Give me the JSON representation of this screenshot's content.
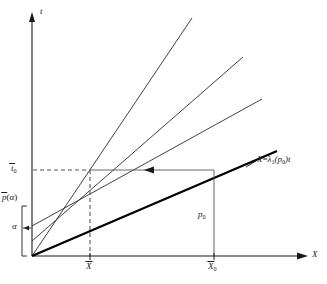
{
  "figure": {
    "type": "characteristics-diagram",
    "background": "#ffffff",
    "ink": "#1a1a1a",
    "thin_stroke": "#2b2b2b",
    "thick_stroke": "#000000",
    "guide_stroke": "#555555",
    "axes": {
      "x_label": "X",
      "y_label": "t",
      "origin_px": [
        32,
        256
      ],
      "x_end_px": [
        310,
        256
      ],
      "y_end_px": [
        32,
        14
      ]
    },
    "y_ticks": [
      {
        "id": "t0bar",
        "text_base": "t",
        "overbar": true,
        "sub": "0",
        "y_px": 170
      },
      {
        "id": "pbar_alpha",
        "text_base": "p",
        "overbar": true,
        "paren": "(α)",
        "y_px": 199
      },
      {
        "id": "alpha",
        "text_base": "α",
        "overbar": false,
        "y_px": 228
      }
    ],
    "x_ticks": [
      {
        "id": "Xbar",
        "text_base": "X",
        "overbar": true,
        "x_px": 90
      },
      {
        "id": "X0bar",
        "text_base": "X",
        "overbar": true,
        "sub": "0",
        "x_px": 214
      }
    ],
    "labels": {
      "t_axis": "t",
      "x_axis": "X",
      "t0_bar": "t̄₀",
      "p_bar_alpha": "p̄(α)",
      "alpha": "α",
      "x_bar": "X̄",
      "x0_bar": "X̄₀",
      "p0": "p₀",
      "characteristic_eq_lhs": "X",
      "characteristic_eq_rel": "=",
      "characteristic_eq_lambda": "λ",
      "characteristic_eq_lambda_sub": "1",
      "characteristic_eq_arg": "(p",
      "characteristic_eq_arg_sub": "0",
      "characteristic_eq_close": ")t"
    },
    "characteristic_lines": [
      {
        "id": "line-1-steepest",
        "x0": 32,
        "y0": 256,
        "x1": 192,
        "y1": 18,
        "width": 0.9,
        "style": "thin"
      },
      {
        "id": "line-2",
        "x0": 32,
        "y0": 241,
        "x1": 243,
        "y1": 57,
        "width": 0.9,
        "style": "thin"
      },
      {
        "id": "line-3",
        "x0": 32,
        "y0": 226,
        "x1": 262,
        "y1": 99,
        "width": 0.9,
        "style": "thin"
      },
      {
        "id": "line-4-thick",
        "x0": 32,
        "y0": 256,
        "x1": 275,
        "y1": 152,
        "width": 2.2,
        "style": "thick"
      }
    ],
    "guides": [
      {
        "id": "dashed-t0-horizontal",
        "kind": "dashed-horizontal",
        "x0": 34,
        "y": 170,
        "x1": 90
      },
      {
        "id": "dashed-Xbar-vertical",
        "kind": "dashed-vertical",
        "x": 90,
        "y0": 170,
        "y1": 256
      },
      {
        "id": "solid-t0-horizontal-arrow",
        "kind": "solid-horizontal-left-arrow",
        "x0": 90,
        "y": 170,
        "x1": 214,
        "arrow_x": 152
      },
      {
        "id": "solid-X0-vertical",
        "kind": "solid-vertical",
        "x": 214,
        "y0": 170,
        "y1": 256
      }
    ],
    "brace": {
      "id": "p0-range-brace",
      "x_px": 22,
      "y_top_px": 206,
      "y_bottom_px": 256,
      "label": "p₀-interval"
    },
    "pointer_tick": {
      "id": "alpha-pointer",
      "x_px": 24,
      "y_px": 228
    }
  }
}
